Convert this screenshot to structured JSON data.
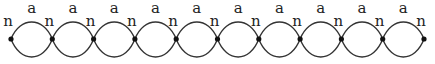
{
  "diagram": {
    "node_label": "n",
    "arc_label": "a",
    "node_count": 11,
    "node_xs": [
      11,
      52.3,
      93.6,
      134.9,
      176.2,
      217.5,
      258.8,
      300.1,
      341.4,
      382.7,
      424
    ],
    "node_y": 39,
    "arc_top_y": 22,
    "arc_bottom_y": 57,
    "stroke_color": "#333333",
    "node_color": "#111111"
  }
}
